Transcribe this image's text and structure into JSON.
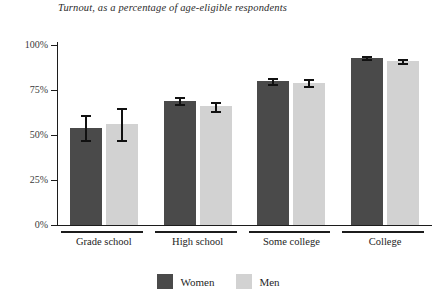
{
  "chart_data": {
    "type": "bar",
    "title": "Turnout, as a percentage of age-eligible respondents",
    "subtitle": "",
    "xlabel": "",
    "ylabel": "",
    "ylim": [
      0,
      100
    ],
    "ytick_labels": [
      "0%",
      "25%",
      "50%",
      "75%",
      "100%"
    ],
    "ytick_values": [
      0,
      25,
      50,
      75,
      100
    ],
    "grid": false,
    "legend_position": "bottom-center",
    "categories": [
      "Grade school",
      "High school",
      "Some college",
      "College"
    ],
    "series": [
      {
        "name": "Women",
        "color": "#4a4a4a",
        "values": [
          54,
          69,
          80,
          93
        ],
        "errors_low": [
          7,
          2,
          1.5,
          1
        ],
        "errors_high": [
          7,
          2,
          1.5,
          1
        ]
      },
      {
        "name": "Men",
        "color": "#d2d2d2",
        "values": [
          56,
          66,
          79,
          91
        ],
        "errors_low": [
          9,
          2.5,
          2,
          1
        ],
        "errors_high": [
          9,
          2.5,
          2,
          1
        ]
      }
    ]
  },
  "legend": {
    "items": [
      {
        "label": "Women",
        "swatch_name": "legend-swatch-women"
      },
      {
        "label": "Men",
        "swatch_name": "legend-swatch-men"
      }
    ]
  },
  "colors": {
    "women": "#4a4a4a",
    "men": "#d2d2d2",
    "axis": "#1c1c1c",
    "error_bar": "#111111",
    "background": "#ffffff",
    "text": "#242424"
  }
}
